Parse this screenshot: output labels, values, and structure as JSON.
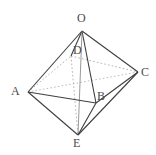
{
  "figure": {
    "name": "solid-geometry-bipyramid",
    "background_color": "#ffffff",
    "edge_color": "#3f3f3f",
    "hidden_edge_color": "#9a9a9a",
    "label_color": "#4a4a4a",
    "width": 156,
    "height": 155
  },
  "vertices": [
    {
      "id": "O",
      "label": "O",
      "x": 82,
      "y": 31,
      "label_x": 77,
      "label_y": 12
    },
    {
      "id": "D",
      "label": "D",
      "x": 71,
      "y": 56,
      "label_x": 73,
      "label_y": 44
    },
    {
      "id": "C",
      "label": "C",
      "x": 138,
      "y": 72,
      "label_x": 141,
      "label_y": 67
    },
    {
      "id": "A",
      "label": "A",
      "x": 28,
      "y": 92,
      "label_x": 11,
      "label_y": 86
    },
    {
      "id": "B",
      "label": "B",
      "x": 96,
      "y": 103,
      "label_x": 97,
      "label_y": 90
    },
    {
      "id": "E",
      "label": "E",
      "x": 78,
      "y": 135,
      "label_x": 73,
      "label_y": 137
    }
  ],
  "edges": [
    {
      "from": "O",
      "to": "A",
      "style": "solid"
    },
    {
      "from": "O",
      "to": "C",
      "style": "solid"
    },
    {
      "from": "O",
      "to": "E",
      "style": "solid"
    },
    {
      "from": "O",
      "to": "D",
      "style": "solid"
    },
    {
      "from": "O",
      "to": "B",
      "style": "solid"
    },
    {
      "from": "A",
      "to": "E",
      "style": "solid"
    },
    {
      "from": "A",
      "to": "B",
      "style": "solid"
    },
    {
      "from": "C",
      "to": "E",
      "style": "solid"
    },
    {
      "from": "B",
      "to": "C",
      "style": "solid"
    },
    {
      "from": "B",
      "to": "E",
      "style": "solid"
    },
    {
      "from": "A",
      "to": "D",
      "style": "dotted"
    },
    {
      "from": "D",
      "to": "C",
      "style": "dotted"
    },
    {
      "from": "D",
      "to": "E",
      "style": "dotted"
    },
    {
      "from": "A",
      "to": "C",
      "style": "dotted"
    }
  ]
}
